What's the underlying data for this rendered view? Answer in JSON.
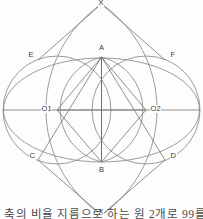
{
  "figure": {
    "type": "geometric-construction",
    "background_color": "#fdfdfd",
    "stroke_color": "#8a8a8a",
    "label_color": "#3a3a3a"
  },
  "points": [
    {
      "id": "x-top",
      "label": "X",
      "x": 101.5,
      "y": 4,
      "lx": 98,
      "ly": 0
    },
    {
      "id": "a",
      "label": "A",
      "x": 101.5,
      "y": 57,
      "lx": 98.5,
      "ly": 44
    },
    {
      "id": "e",
      "label": "E",
      "x": 38,
      "y": 60,
      "lx": 28,
      "ly": 52
    },
    {
      "id": "f",
      "label": "F",
      "x": 165,
      "y": 60,
      "lx": 170,
      "ly": 52
    },
    {
      "id": "o1",
      "label": "O1",
      "x": 57,
      "y": 110,
      "lx": 41,
      "ly": 105
    },
    {
      "id": "o2",
      "label": "O2",
      "x": 146,
      "y": 110,
      "lx": 150,
      "ly": 105
    },
    {
      "id": "c",
      "label": "C",
      "x": 38,
      "y": 160,
      "lx": 29,
      "ly": 152
    },
    {
      "id": "d",
      "label": "D",
      "x": 165,
      "y": 160,
      "lx": 170,
      "ly": 152
    },
    {
      "id": "b",
      "label": "B",
      "x": 101.5,
      "y": 162,
      "lx": 98.5,
      "ly": 166
    },
    {
      "id": "x-bottom",
      "label": "X",
      "x": 101.5,
      "y": 215,
      "lx": 98,
      "ly": 209
    }
  ],
  "caption": {
    "text": "축의 비율 지름으로 하는 원 2개로 99를 그",
    "visible": "partially cut off at bottom edge"
  },
  "geometry": {
    "circle_left": {
      "cx": 57,
      "cy": 110,
      "r": 54
    },
    "circle_right": {
      "cx": 146,
      "cy": 110,
      "r": 54
    },
    "ellipse": {
      "cx": 101.5,
      "cy": 110,
      "rx": 98,
      "ry": 52
    },
    "horizontal_axis": {
      "x1": 3,
      "y1": 110,
      "x2": 200,
      "y2": 110
    },
    "vertical_chord": {
      "x1": 101.5,
      "y1": 57,
      "x2": 101.5,
      "y2": 162
    }
  }
}
